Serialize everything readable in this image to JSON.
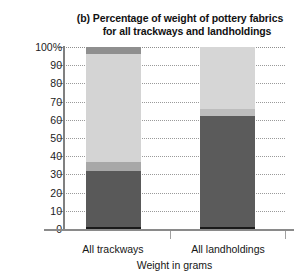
{
  "chart_data": {
    "type": "bar",
    "stacked": true,
    "title": "(b) Percentage of weight of pottery fabrics for all trackways and landholdings",
    "title_line1": "(b) Percentage of weight of pottery fabrics",
    "title_line2": "for all trackways and landholdings",
    "xlabel": "Weight in grams",
    "ylabel": "",
    "ylim": [
      0,
      100
    ],
    "ytick_labels": [
      "100%",
      "90",
      "80",
      "70",
      "60",
      "50",
      "40",
      "30",
      "20",
      "10",
      "0"
    ],
    "ytick_values": [
      100,
      90,
      80,
      70,
      60,
      50,
      40,
      30,
      20,
      10,
      0
    ],
    "grid": true,
    "legend": "none",
    "categories": [
      "All trackways",
      "All landholdings"
    ],
    "series": [
      {
        "name": "dark-fabric",
        "color": "#595959",
        "values": [
          32,
          62
        ]
      },
      {
        "name": "mid-fabric",
        "color": "#a8a8a8",
        "values": [
          5,
          4
        ]
      },
      {
        "name": "light-fabric",
        "color": "#d4d4d4",
        "values": [
          59,
          34
        ]
      },
      {
        "name": "cap-fabric",
        "color": "#8f8f8f",
        "values": [
          4,
          0
        ]
      }
    ],
    "bars": [
      {
        "category": "All trackways",
        "segments": [
          {
            "name": "dark-fabric",
            "from": 0,
            "to": 32,
            "color": "#595959"
          },
          {
            "name": "mid-fabric",
            "from": 32,
            "to": 37,
            "color": "#a8a8a8"
          },
          {
            "name": "light-fabric",
            "from": 37,
            "to": 96,
            "color": "#d4d4d4"
          },
          {
            "name": "cap-fabric",
            "from": 96,
            "to": 100,
            "color": "#8f8f8f"
          }
        ]
      },
      {
        "category": "All landholdings",
        "segments": [
          {
            "name": "dark-fabric",
            "from": 0,
            "to": 62,
            "color": "#5b5b5b"
          },
          {
            "name": "mid-fabric",
            "from": 62,
            "to": 66,
            "color": "#bdbdbd"
          },
          {
            "name": "light-fabric",
            "from": 66,
            "to": 100,
            "color": "#d6d6d6"
          }
        ]
      }
    ]
  },
  "colors": {
    "background": "#ffffff",
    "axis": "#8a8a8a",
    "grid": "#9a9a9a",
    "text": "#161616",
    "bar_baseline": "#1a1a1a"
  }
}
